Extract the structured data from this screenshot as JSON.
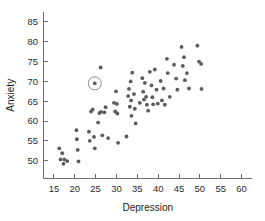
{
  "chart_data": {
    "type": "scatter",
    "title": "",
    "xlabel": "Depression",
    "ylabel": "Anxiety",
    "xlim": [
      12.5,
      62.5
    ],
    "ylim": [
      45.5,
      87.5
    ],
    "xticks": [
      15,
      20,
      25,
      30,
      35,
      40,
      45,
      50,
      55,
      60
    ],
    "yticks": [
      50,
      55,
      60,
      65,
      70,
      75,
      80,
      85
    ],
    "grid": false,
    "legend": null,
    "marker": {
      "shape": "circle",
      "size_px": 1.9,
      "color": "#5b5b5b"
    },
    "highlight": {
      "x": 24.8,
      "y": 69.5,
      "ring_radius_px": 6.5,
      "ring_color": "#8a8a8a",
      "label": "circled-outlier-point"
    },
    "points": [
      [
        16.3,
        53.1
      ],
      [
        16.6,
        50.3
      ],
      [
        17.0,
        51.9
      ],
      [
        17.3,
        49.2
      ],
      [
        17.5,
        50.3
      ],
      [
        18.2,
        49.9
      ],
      [
        20.4,
        57.7
      ],
      [
        20.5,
        55.4
      ],
      [
        20.7,
        52.7
      ],
      [
        20.9,
        49.8
      ],
      [
        23.4,
        57.3
      ],
      [
        23.6,
        55.0
      ],
      [
        23.9,
        62.4
      ],
      [
        24.3,
        62.9
      ],
      [
        24.6,
        56.0
      ],
      [
        24.8,
        53.1
      ],
      [
        24.8,
        69.5
      ],
      [
        25.6,
        59.6
      ],
      [
        25.9,
        62.0
      ],
      [
        26.2,
        73.5
      ],
      [
        26.3,
        62.3
      ],
      [
        26.6,
        56.4
      ],
      [
        27.1,
        62.2
      ],
      [
        27.4,
        63.5
      ],
      [
        28.0,
        55.7
      ],
      [
        29.4,
        64.6
      ],
      [
        29.7,
        62.4
      ],
      [
        29.9,
        67.5
      ],
      [
        30.1,
        64.3
      ],
      [
        30.2,
        61.9
      ],
      [
        30.4,
        54.5
      ],
      [
        32.4,
        56.1
      ],
      [
        32.8,
        66.3
      ],
      [
        33.0,
        68.1
      ],
      [
        33.2,
        63.6
      ],
      [
        33.4,
        70.0
      ],
      [
        33.5,
        65.2
      ],
      [
        33.6,
        61.3
      ],
      [
        33.8,
        72.2
      ],
      [
        34.2,
        66.8
      ],
      [
        34.4,
        63.1
      ],
      [
        34.6,
        59.4
      ],
      [
        35.6,
        64.6
      ],
      [
        36.2,
        70.8
      ],
      [
        36.4,
        67.4
      ],
      [
        36.6,
        65.4
      ],
      [
        36.8,
        69.6
      ],
      [
        37.1,
        66.1
      ],
      [
        37.3,
        64.1
      ],
      [
        37.6,
        62.6
      ],
      [
        38.0,
        72.4
      ],
      [
        38.4,
        69.0
      ],
      [
        38.6,
        66.0
      ],
      [
        38.8,
        64.2
      ],
      [
        39.2,
        73.0
      ],
      [
        39.6,
        67.9
      ],
      [
        39.9,
        64.4
      ],
      [
        40.6,
        70.1
      ],
      [
        40.9,
        65.2
      ],
      [
        41.3,
        68.2
      ],
      [
        41.6,
        64.1
      ],
      [
        42.1,
        75.7
      ],
      [
        42.3,
        72.1
      ],
      [
        42.8,
        66.1
      ],
      [
        43.8,
        74.2
      ],
      [
        44.3,
        70.7
      ],
      [
        44.6,
        67.9
      ],
      [
        45.6,
        78.7
      ],
      [
        45.9,
        73.9
      ],
      [
        46.2,
        76.1
      ],
      [
        46.4,
        70.3
      ],
      [
        46.9,
        72.1
      ],
      [
        47.4,
        68.2
      ],
      [
        49.4,
        79.0
      ],
      [
        49.8,
        75.0
      ],
      [
        50.3,
        74.4
      ],
      [
        50.4,
        68.1
      ]
    ]
  }
}
